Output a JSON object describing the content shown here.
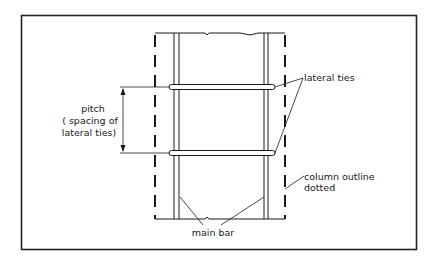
{
  "diagram": {
    "labels": {
      "lateral_ties": "lateral ties",
      "pitch_line1": "pitch",
      "pitch_line2": "( spacing of",
      "pitch_line3": "lateral ties)",
      "column_outline_line1": "column outline",
      "column_outline_line2": "dotted",
      "main_bar": "main bar"
    },
    "colors": {
      "line": "#1a1a1a",
      "frame": "#222222",
      "background": "#ffffff"
    }
  }
}
